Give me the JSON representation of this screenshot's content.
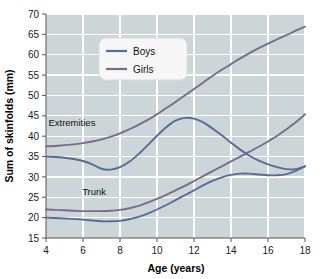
{
  "chart_data": {
    "type": "line",
    "title": "",
    "xlabel": "Age (years)",
    "ylabel": "Sum of skinfolds (mm)",
    "xlim": [
      4,
      18
    ],
    "ylim": [
      15,
      70
    ],
    "xticks": [
      4,
      6,
      8,
      10,
      12,
      14,
      16,
      18
    ],
    "yticks": [
      15,
      20,
      25,
      30,
      35,
      40,
      45,
      50,
      55,
      60,
      65,
      70
    ],
    "grid": true,
    "legend_position": "upper-center",
    "legend": [
      {
        "name": "Boys",
        "color": "#6b7ba3"
      },
      {
        "name": "Girls",
        "color": "#7a6b8c"
      }
    ],
    "annotations": [
      {
        "text": "Extremities",
        "x": 5.4,
        "y": 42.5
      },
      {
        "text": "Trunk",
        "x": 6.6,
        "y": 25.6
      }
    ],
    "x": [
      4,
      4.5,
      5,
      5.5,
      6,
      6.5,
      7,
      7.5,
      8,
      8.5,
      9,
      9.5,
      10,
      10.5,
      11,
      11.5,
      12,
      12.5,
      13,
      13.5,
      14,
      14.5,
      15,
      15.5,
      16,
      16.5,
      17,
      17.5,
      18
    ],
    "series": [
      {
        "name": "Girls extremities",
        "group": "Girls",
        "region": "Extremities",
        "color": "#7a6b8c",
        "values": [
          37.5,
          37.6,
          37.8,
          38.0,
          38.3,
          38.7,
          39.2,
          39.9,
          40.7,
          41.7,
          42.8,
          44.0,
          45.4,
          46.9,
          48.4,
          50.0,
          51.6,
          53.2,
          54.8,
          56.3,
          57.7,
          59.1,
          60.4,
          61.6,
          62.7,
          63.8,
          64.8,
          65.9,
          66.9
        ]
      },
      {
        "name": "Boys extremities",
        "group": "Boys",
        "region": "Extremities",
        "color": "#5a6a96",
        "values": [
          35.0,
          34.9,
          34.7,
          34.4,
          33.9,
          33.1,
          32.0,
          31.8,
          32.4,
          33.7,
          35.6,
          37.8,
          40.1,
          42.2,
          43.8,
          44.5,
          44.3,
          43.4,
          41.9,
          40.2,
          38.4,
          36.7,
          35.2,
          34.0,
          33.1,
          32.4,
          31.9,
          31.9,
          32.6
        ]
      },
      {
        "name": "Girls trunk",
        "group": "Girls",
        "region": "Trunk",
        "color": "#7a6b8c",
        "values": [
          22.0,
          21.9,
          21.8,
          21.7,
          21.6,
          21.6,
          21.6,
          21.7,
          21.9,
          22.3,
          22.9,
          23.7,
          24.6,
          25.6,
          26.7,
          27.8,
          29.0,
          30.2,
          31.4,
          32.6,
          33.8,
          35.0,
          36.2,
          37.4,
          38.7,
          40.1,
          41.7,
          43.4,
          45.4
        ]
      },
      {
        "name": "Boys trunk",
        "group": "Boys",
        "region": "Trunk",
        "color": "#5a6a96",
        "values": [
          20.0,
          19.9,
          19.8,
          19.7,
          19.5,
          19.3,
          19.1,
          19.1,
          19.2,
          19.6,
          20.2,
          21.0,
          22.0,
          23.1,
          24.3,
          25.5,
          26.7,
          27.9,
          29.0,
          29.9,
          30.5,
          30.8,
          30.8,
          30.6,
          30.4,
          30.4,
          30.7,
          31.5,
          32.6
        ]
      }
    ],
    "colors": {
      "plot_background": "#ccd6d9",
      "gridline": "#ffffff",
      "axis": "#555555",
      "page_background": "#ffffff",
      "legend_background": "#f7f7f7"
    }
  }
}
